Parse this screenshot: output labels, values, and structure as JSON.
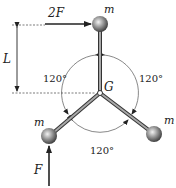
{
  "diagram": {
    "labels": {
      "top_force": "2F",
      "bottom_force": "F",
      "length": "L",
      "center": "G",
      "mass_top": "m",
      "mass_left": "m",
      "mass_right": "m"
    },
    "angles": {
      "upper_left": "120°",
      "upper_right": "120°",
      "bottom": "120°"
    },
    "colors": {
      "ink": "#222222",
      "rod": "#8a8a8a",
      "ball": "#9a9a9a"
    }
  }
}
